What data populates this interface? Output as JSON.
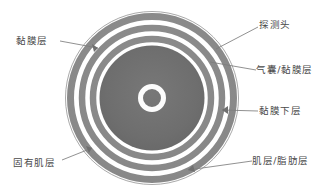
{
  "figure": {
    "type": "anatomical-cross-section",
    "background_color": "#ffffff",
    "outline_color": "#9a9a9a",
    "leader_line_color": "#7d7d7d",
    "text_color": "#4a4a4a"
  },
  "rings": [
    {
      "name": "outer-boundary",
      "outer_radius": 88,
      "inner_radius": 85,
      "fill": "#ffffff",
      "stroke": "#a8a8a8"
    },
    {
      "name": "muscle-fat-band",
      "outer_radius": 85,
      "inner_radius": 78,
      "fill": "#8d8d8d",
      "stroke": "none"
    },
    {
      "name": "gap-band-outer",
      "outer_radius": 78,
      "inner_radius": 73,
      "fill": "#fbfbfb",
      "stroke": "none"
    },
    {
      "name": "submucosa-band",
      "outer_radius": 73,
      "inner_radius": 67,
      "fill": "#8d8d8d",
      "stroke": "none"
    },
    {
      "name": "gap-band-inner",
      "outer_radius": 67,
      "inner_radius": 62,
      "fill": "#fbfbfb",
      "stroke": "none"
    },
    {
      "name": "mucosa-band",
      "outer_radius": 62,
      "inner_radius": 56,
      "fill": "#8d8d8d",
      "stroke": "none"
    },
    {
      "name": "gap-band-innermost",
      "outer_radius": 56,
      "inner_radius": 52,
      "fill": "#fbfbfb",
      "stroke": "none"
    },
    {
      "name": "lumen-core",
      "outer_radius": 52,
      "inner_radius": 0,
      "fill": "#6e6e6e",
      "stroke": "none"
    },
    {
      "name": "probe-ring",
      "outer_radius": 14,
      "inner_radius": 9,
      "fill": "#ffffff",
      "stroke": "none"
    }
  ],
  "labels": {
    "mucosa_layer": "黏膜层",
    "muscularis_propria": "固有肌层",
    "probe_head": "探测头",
    "balloon_mucosa_layer": "气囊/黏膜层",
    "submucosa_layer": "黏膜下层",
    "muscle_fat_layer": "肌层/脂肪层"
  },
  "leaders": [
    {
      "name": "leader-mucosa-layer",
      "from": [
        60,
        41
      ],
      "to": [
        98,
        48
      ],
      "arrow": true
    },
    {
      "name": "leader-muscularis-propria",
      "from": [
        62,
        160
      ],
      "to": [
        92,
        148
      ],
      "arrow": true
    },
    {
      "name": "leader-probe-head",
      "from": [
        258,
        27
      ],
      "to": [
        216,
        49
      ],
      "arrow": false
    },
    {
      "name": "leader-balloon-mucosa",
      "from": [
        256,
        70
      ],
      "to": [
        210,
        62
      ],
      "arrow": false
    },
    {
      "name": "leader-submucosa",
      "from": [
        258,
        111
      ],
      "to": [
        222,
        110
      ],
      "arrow": true
    },
    {
      "name": "leader-muscle-fat-layer",
      "from": [
        252,
        161
      ],
      "to": [
        188,
        170
      ],
      "arrow": true
    }
  ],
  "geometry": {
    "center_x": 152,
    "center_y": 98,
    "canvas_width": 332,
    "canvas_height": 196
  }
}
